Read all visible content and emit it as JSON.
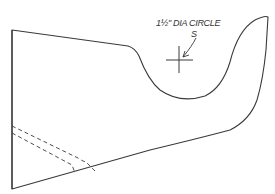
{
  "drawing": {
    "title": "Shaped board template",
    "annotation": {
      "label": "1½\" DIA CIRCLE",
      "leader_glyph": "S"
    },
    "colors": {
      "line": "#3a3a3a",
      "background": "#ffffff"
    }
  }
}
